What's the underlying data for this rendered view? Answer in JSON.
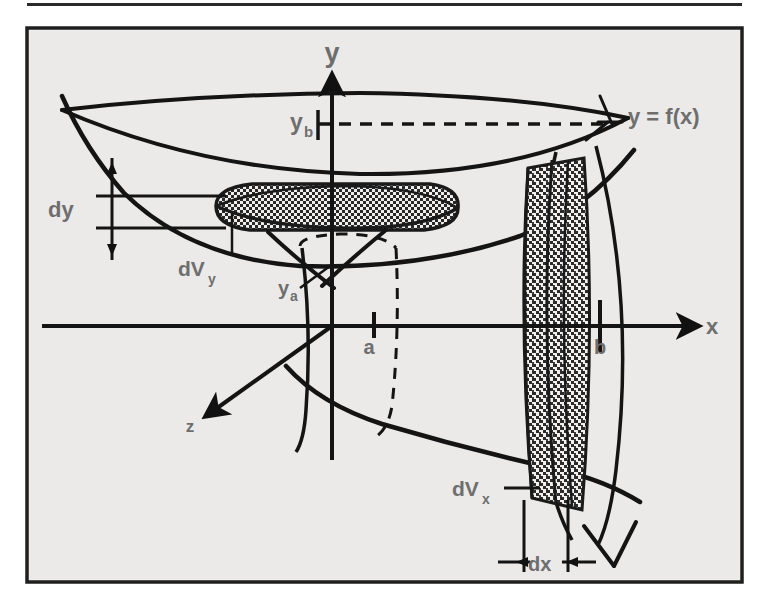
{
  "figure": {
    "background_color": "#eeeeec",
    "page_color": "#ffffff",
    "frame_color": "#1a1a1a",
    "ink_color": "#141414",
    "label_color": "#6e6e6e",
    "rule": {
      "present": true,
      "y": 5,
      "x1": 27,
      "x2": 742
    },
    "frame": {
      "x": 27,
      "y": 28,
      "width": 715,
      "height": 554
    }
  },
  "axes": [
    {
      "id": "y-axis",
      "label": "y",
      "label_x": 332,
      "label_y": 62,
      "font_size": 27
    },
    {
      "id": "x-axis",
      "label": "x",
      "label_x": 712,
      "label_y": 334,
      "font_size": 22
    },
    {
      "id": "z-axis",
      "label": "z",
      "label_x": 190,
      "label_y": 432,
      "font_size": 17
    }
  ],
  "labels": [
    {
      "id": "curve-label",
      "name": "y = f(x)",
      "base": "y = f(x)",
      "sub": "",
      "x": 628,
      "y": 124,
      "font_size": 22
    },
    {
      "id": "yb-label",
      "name": "y_b",
      "base": "y",
      "sub": "b",
      "x": 290,
      "y": 130,
      "font_size": 23
    },
    {
      "id": "ya-label",
      "name": "y_a",
      "base": "y",
      "sub": "a",
      "x": 282,
      "y": 295,
      "font_size": 20
    },
    {
      "id": "dy-label",
      "name": "dy",
      "base": "dy",
      "sub": "",
      "x": 48,
      "y": 217,
      "font_size": 22
    },
    {
      "id": "dvy-label",
      "name": "dV_y",
      "base": "dV",
      "sub": "y",
      "x": 182,
      "y": 276,
      "font_size": 21
    },
    {
      "id": "dvx-label",
      "name": "dV_x",
      "base": "dV",
      "sub": "x",
      "x": 455,
      "y": 496,
      "font_size": 21
    },
    {
      "id": "dx-label",
      "name": "dx",
      "base": "dx",
      "sub": "",
      "x": 538,
      "y": 571,
      "font_size": 20
    },
    {
      "id": "a-label",
      "name": "a",
      "base": "a",
      "sub": "",
      "x": 369,
      "y": 354,
      "font_size": 20
    },
    {
      "id": "b-label",
      "name": "b",
      "base": "b",
      "sub": "",
      "x": 600,
      "y": 354,
      "font_size": 20
    }
  ],
  "elements": {
    "disc_x": {
      "name": "dVx-disc",
      "description": "vertical hatched disc at x = b"
    },
    "disc_y": {
      "name": "dVy-washer",
      "description": "horizontal hatched washer at height y"
    },
    "dashed_ellipse": {
      "name": "inner-radius-ellipse"
    },
    "dashed_yb_line": {
      "name": "yb-dashed-line"
    },
    "dashed_a_line": {
      "name": "a-dashed-line"
    }
  }
}
